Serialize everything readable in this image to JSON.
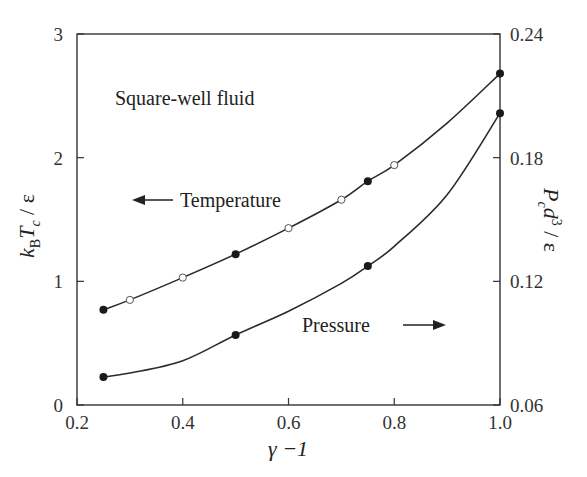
{
  "chart_data": {
    "type": "line",
    "title": "",
    "annotation": "Square-well fluid",
    "xlabel": "γ −1",
    "ylabel_left": "k_B T_c / ε",
    "ylabel_right": "P_c d^3 / ε",
    "xlim": [
      0.2,
      1.0
    ],
    "ylim_left": [
      0,
      3
    ],
    "ylim_right": [
      0.06,
      0.24
    ],
    "xticks": [
      "0.2",
      "0.4",
      "0.6",
      "0.8",
      "1.0"
    ],
    "yticks_left": [
      "0",
      "1",
      "2",
      "3"
    ],
    "yticks_right": [
      "0.06",
      "0.12",
      "0.18",
      "0.24"
    ],
    "grid": false,
    "legend": "none (inline arrow labels)",
    "series": [
      {
        "name": "Temperature",
        "axis": "left",
        "arrow": "left",
        "curve_x": [
          0.25,
          0.3,
          0.4,
          0.5,
          0.6,
          0.7,
          0.75,
          0.8,
          0.9,
          1.0
        ],
        "curve_y": [
          0.77,
          0.85,
          1.03,
          1.22,
          1.43,
          1.66,
          1.81,
          1.94,
          2.28,
          2.68
        ],
        "filled_points": {
          "x": [
            0.25,
            0.5,
            0.75,
            1.0
          ],
          "y": [
            0.77,
            1.22,
            1.81,
            2.68
          ]
        },
        "open_points": {
          "x": [
            0.3,
            0.4,
            0.6,
            0.7,
            0.8
          ],
          "y": [
            0.85,
            1.03,
            1.43,
            1.66,
            1.94
          ]
        }
      },
      {
        "name": "Pressure",
        "axis": "right",
        "arrow": "right",
        "curve_x": [
          0.25,
          0.3,
          0.4,
          0.5,
          0.6,
          0.7,
          0.75,
          0.8,
          0.9,
          1.0
        ],
        "curve_y": [
          0.0736,
          0.0755,
          0.0815,
          0.094,
          0.1055,
          0.119,
          0.1274,
          0.137,
          0.162,
          0.2016
        ],
        "filled_points": {
          "x": [
            0.25,
            0.5,
            0.75,
            1.0
          ],
          "y": [
            0.0736,
            0.094,
            0.1274,
            0.2016
          ]
        },
        "open_points": {
          "x": [],
          "y": []
        }
      }
    ]
  },
  "labels": {
    "annotation": "Square-well fluid",
    "temperature": "Temperature",
    "pressure": "Pressure",
    "xlabel": "γ −1"
  },
  "colors": {
    "line": "#2b2b2b",
    "axis": "#333333",
    "point_fill": "#1a1a1a",
    "open_fill": "#ffffff"
  }
}
